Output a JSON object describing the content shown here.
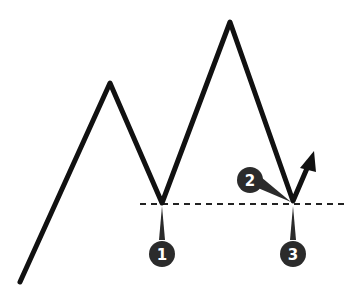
{
  "diagram": {
    "colors": {
      "line": "#111111",
      "marker_fill": "#2b2b2b",
      "marker_text": "#ffffff",
      "dashed_line": "#222222",
      "background": "#ffffff"
    },
    "price_path": [
      [
        20,
        282
      ],
      [
        110,
        83
      ],
      [
        162,
        203
      ],
      [
        230,
        22
      ],
      [
        293,
        201
      ],
      [
        312,
        160
      ]
    ],
    "arrow_tip": [
      313,
      153
    ],
    "support_line": {
      "x1": 140,
      "x2": 348,
      "y": 204,
      "style": "dashed"
    },
    "markers": [
      {
        "label": "1",
        "cx": 162,
        "cy": 254,
        "pointer_to": [
          162,
          206
        ]
      },
      {
        "label": "2",
        "cx": 250,
        "cy": 180,
        "pointer_to": [
          291,
          202
        ]
      },
      {
        "label": "3",
        "cx": 293,
        "cy": 254,
        "pointer_to": [
          293,
          206
        ]
      }
    ]
  }
}
